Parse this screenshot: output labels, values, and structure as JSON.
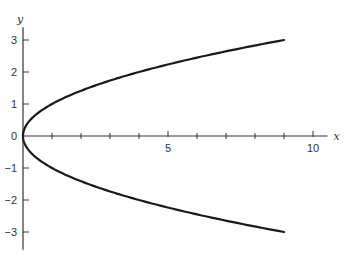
{
  "chart_data": {
    "type": "line",
    "title": "",
    "xlabel": "x",
    "ylabel": "y",
    "xlim": [
      0,
      10.5
    ],
    "ylim": [
      -3.4,
      3.4
    ],
    "grid": false,
    "legend": null,
    "x_ticks": [
      1,
      2,
      3,
      4,
      5,
      6,
      7,
      8,
      9,
      10
    ],
    "x_tick_labels": [
      {
        "value": 5,
        "label": "5"
      },
      {
        "value": 10,
        "label": "10"
      }
    ],
    "y_ticks": [
      -3,
      -2,
      -1,
      0,
      1,
      2,
      3
    ],
    "y_tick_labels": [
      {
        "value": 3,
        "label": "3"
      },
      {
        "value": 2,
        "label": "2"
      },
      {
        "value": 1,
        "label": "1"
      },
      {
        "value": 0,
        "label": "0"
      },
      {
        "value": -1,
        "label": "−1"
      },
      {
        "value": -2,
        "label": "−2"
      },
      {
        "value": -3,
        "label": "−3"
      }
    ],
    "series": [
      {
        "name": "y = sqrt(x)",
        "x": [
          0,
          0.25,
          1,
          2,
          3,
          4,
          5,
          6,
          7,
          8,
          9
        ],
        "y": [
          0,
          0.5,
          1,
          1.414,
          1.732,
          2,
          2.236,
          2.449,
          2.646,
          2.828,
          3
        ]
      },
      {
        "name": "y = -sqrt(x)",
        "x": [
          0,
          0.25,
          1,
          2,
          3,
          4,
          5,
          6,
          7,
          8,
          9
        ],
        "y": [
          0,
          -0.5,
          -1,
          -1.414,
          -1.732,
          -2,
          -2.236,
          -2.449,
          -2.646,
          -2.828,
          -3
        ]
      }
    ],
    "line_color": "#1a1a1a"
  }
}
